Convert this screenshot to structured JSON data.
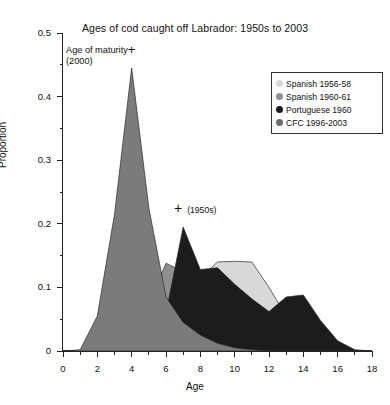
{
  "chart_data": {
    "type": "area",
    "title": "Ages of cod caught off Labrador: 1950s to 2003",
    "xlabel": "Age",
    "ylabel": "Proportion",
    "xlim": [
      0,
      18
    ],
    "ylim": [
      0,
      0.5
    ],
    "grid": false,
    "legend_position": "top-right",
    "x_ticks_major": [
      0,
      2,
      4,
      6,
      8,
      10,
      12,
      14,
      16,
      18
    ],
    "x_ticks_minor": [
      1,
      3,
      5,
      7,
      9,
      11,
      13,
      15,
      17
    ],
    "y_ticks_major": [
      "0",
      "0.1",
      "0.2",
      "0.3",
      "0.4",
      "0.5"
    ],
    "y_ticks_major_values": [
      0,
      0.1,
      0.2,
      0.3,
      0.4,
      0.5
    ],
    "y_ticks_minor": [
      0.05,
      0.15,
      0.25,
      0.35,
      0.45
    ],
    "x": [
      0,
      1,
      2,
      3,
      4,
      5,
      6,
      7,
      8,
      9,
      10,
      11,
      12,
      13,
      14,
      15,
      16,
      17,
      18
    ],
    "series": [
      {
        "name": "Spanish 1956-58",
        "color": "#d8d8d8",
        "values": [
          0,
          0,
          0,
          0,
          0,
          0.005,
          0.02,
          0.06,
          0.115,
          0.14,
          0.141,
          0.14,
          0.1,
          0.055,
          0.03,
          0.012,
          0.004,
          0,
          0
        ]
      },
      {
        "name": "Spanish 1960-61",
        "color": "#8f8f8f",
        "values": [
          0,
          0,
          0.005,
          0.02,
          0.038,
          0.075,
          0.138,
          0.125,
          0.09,
          0.055,
          0.03,
          0.015,
          0.006,
          0.002,
          0,
          0,
          0,
          0,
          0
        ]
      },
      {
        "name": "Portuguese 1960",
        "color": "#1c1c1c",
        "values": [
          0,
          0,
          0,
          0,
          0,
          0.008,
          0.06,
          0.195,
          0.128,
          0.131,
          0.105,
          0.082,
          0.062,
          0.085,
          0.088,
          0.048,
          0.016,
          0.002,
          0
        ]
      },
      {
        "name": "CFC 1996-2003",
        "color": "#7b7b7b",
        "values": [
          0,
          0.002,
          0.055,
          0.215,
          0.445,
          0.225,
          0.085,
          0.045,
          0.025,
          0.012,
          0.005,
          0.002,
          0,
          0,
          0,
          0,
          0,
          0,
          0
        ]
      }
    ],
    "annotations": [
      {
        "id": "age-of-maturity",
        "line1": "Age of maturity",
        "line2": "(2000)",
        "marker": "+",
        "x": 4,
        "y": 0.475
      },
      {
        "id": "age-of-maturity-1950s",
        "label": "(1950s)",
        "marker": "+",
        "x": 7,
        "y": 0.218
      }
    ]
  },
  "legend": {
    "items": [
      {
        "label": "Spanish 1956-58",
        "color": "#d8d8d8"
      },
      {
        "label": "Spanish 1960-61",
        "color": "#8f8f8f"
      },
      {
        "label": "Portuguese 1960",
        "color": "#1c1c1c"
      },
      {
        "label": "CFC 1996-2003",
        "color": "#6e6e6e"
      }
    ]
  }
}
